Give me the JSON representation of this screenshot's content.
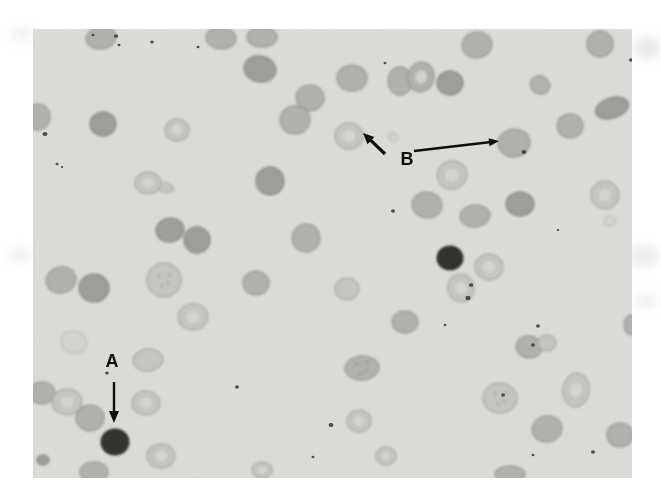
{
  "page": {
    "background": "#ffffff"
  },
  "micrograph": {
    "background": "#dcdcd8",
    "pale_fill": "#d6d6d2",
    "speck_color": "#3a3a38",
    "tones": {
      "light": {
        "fill": "#c5c5c1",
        "rim": "#a4a4a0"
      },
      "mid": {
        "fill": "#b1b1ad",
        "rim": "#92928e"
      },
      "dark_mid": {
        "fill": "#9d9d99",
        "rim": "#81817d"
      },
      "ghost": {
        "fill": "#d3d3cf",
        "rim": "#bbbbb7"
      },
      "very_dark": {
        "fill": "#2d2d2b",
        "rim": "#1b1b19"
      }
    },
    "cells": [
      {
        "x": 68,
        "y": 9,
        "rx": 15,
        "ry": 11,
        "tone": "mid",
        "rot": -8
      },
      {
        "x": 188,
        "y": 9,
        "rx": 15,
        "ry": 11,
        "tone": "mid",
        "rot": 5
      },
      {
        "x": 229,
        "y": 8,
        "rx": 15,
        "ry": 10,
        "tone": "mid"
      },
      {
        "x": 227,
        "y": 40,
        "rx": 16,
        "ry": 13,
        "tone": "dark_mid",
        "rot": 10
      },
      {
        "x": 277,
        "y": 69,
        "rx": 14,
        "ry": 13,
        "tone": "mid"
      },
      {
        "x": 262,
        "y": 91,
        "rx": 15,
        "ry": 14,
        "tone": "mid"
      },
      {
        "x": 5,
        "y": 88,
        "rx": 12,
        "ry": 13,
        "tone": "mid"
      },
      {
        "x": 70,
        "y": 95,
        "rx": 13,
        "ry": 12,
        "tone": "dark_mid"
      },
      {
        "x": 144,
        "y": 101,
        "rx": 12,
        "ry": 11,
        "tone": "light",
        "pale": true
      },
      {
        "x": 115,
        "y": 154,
        "rx": 13,
        "ry": 11,
        "tone": "light",
        "pale": true,
        "tail": {
          "dx": 16,
          "dy": 4,
          "rx": 10,
          "ry": 5,
          "rot": 16
        }
      },
      {
        "x": 237,
        "y": 152,
        "rx": 14,
        "ry": 14,
        "tone": "dark_mid"
      },
      {
        "x": 137,
        "y": 201,
        "rx": 14,
        "ry": 12,
        "tone": "dark_mid",
        "rot": -10
      },
      {
        "x": 164,
        "y": 211,
        "rx": 13,
        "ry": 13,
        "tone": "dark_mid"
      },
      {
        "x": 273,
        "y": 209,
        "rx": 14,
        "ry": 14,
        "tone": "mid"
      },
      {
        "x": 28,
        "y": 251,
        "rx": 15,
        "ry": 13,
        "tone": "mid",
        "rot": -15
      },
      {
        "x": 61,
        "y": 259,
        "rx": 15,
        "ry": 14,
        "tone": "dark_mid"
      },
      {
        "x": 131,
        "y": 251,
        "rx": 17,
        "ry": 17,
        "tone": "light",
        "mottle": true
      },
      {
        "x": 223,
        "y": 254,
        "rx": 13,
        "ry": 12,
        "tone": "mid"
      },
      {
        "x": 160,
        "y": 288,
        "rx": 15,
        "ry": 13,
        "tone": "light",
        "pale": true
      },
      {
        "x": 41,
        "y": 313,
        "rx": 13,
        "ry": 11,
        "tone": "ghost",
        "rot": 20
      },
      {
        "x": 115,
        "y": 331,
        "rx": 15,
        "ry": 11,
        "tone": "light",
        "rot": -5
      },
      {
        "x": 9,
        "y": 364,
        "rx": 13,
        "ry": 11,
        "tone": "mid"
      },
      {
        "x": 34,
        "y": 373,
        "rx": 15,
        "ry": 13,
        "tone": "light",
        "pale": true
      },
      {
        "x": 57,
        "y": 389,
        "rx": 14,
        "ry": 13,
        "tone": "mid"
      },
      {
        "x": 113,
        "y": 374,
        "rx": 14,
        "ry": 12,
        "tone": "light",
        "pale": true
      },
      {
        "x": 82,
        "y": 413,
        "rx": 14,
        "ry": 13,
        "tone": "very_dark"
      },
      {
        "x": 128,
        "y": 427,
        "rx": 14,
        "ry": 12,
        "tone": "light",
        "pale": true
      },
      {
        "x": 61,
        "y": 443,
        "rx": 14,
        "ry": 10,
        "tone": "mid"
      },
      {
        "x": 10,
        "y": 431,
        "rx": 6,
        "ry": 5,
        "tone": "dark_mid"
      },
      {
        "x": 319,
        "y": 49,
        "rx": 15,
        "ry": 13,
        "tone": "mid"
      },
      {
        "x": 367,
        "y": 52,
        "rx": 12,
        "ry": 14,
        "tone": "mid"
      },
      {
        "x": 388,
        "y": 48,
        "rx": 13,
        "ry": 15,
        "tone": "mid",
        "pale": true,
        "rot": 15
      },
      {
        "x": 417,
        "y": 54,
        "rx": 13,
        "ry": 12,
        "tone": "dark_mid"
      },
      {
        "x": 444,
        "y": 16,
        "rx": 15,
        "ry": 13,
        "tone": "mid",
        "rot": -10
      },
      {
        "x": 567,
        "y": 15,
        "rx": 13,
        "ry": 13,
        "tone": "mid"
      },
      {
        "x": 507,
        "y": 56,
        "rx": 10,
        "ry": 9,
        "tone": "mid",
        "rot": 25
      },
      {
        "x": 579,
        "y": 79,
        "rx": 17,
        "ry": 10,
        "tone": "dark_mid",
        "rot": -18
      },
      {
        "x": 537,
        "y": 97,
        "rx": 13,
        "ry": 12,
        "tone": "mid"
      },
      {
        "x": 316,
        "y": 107,
        "rx": 14,
        "ry": 13,
        "tone": "light",
        "pale": true
      },
      {
        "x": 481,
        "y": 114,
        "rx": 16,
        "ry": 14,
        "tone": "mid",
        "rot": -8
      },
      {
        "x": 419,
        "y": 146,
        "rx": 15,
        "ry": 14,
        "tone": "light",
        "pale": true,
        "rot": -20
      },
      {
        "x": 394,
        "y": 176,
        "rx": 15,
        "ry": 13,
        "tone": "mid",
        "rot": 10
      },
      {
        "x": 442,
        "y": 187,
        "rx": 15,
        "ry": 11,
        "tone": "mid",
        "rot": -5
      },
      {
        "x": 487,
        "y": 175,
        "rx": 14,
        "ry": 12,
        "tone": "dark_mid"
      },
      {
        "x": 572,
        "y": 166,
        "rx": 14,
        "ry": 14,
        "tone": "light",
        "pale": true
      },
      {
        "x": 417,
        "y": 229,
        "rx": 13,
        "ry": 12,
        "tone": "very_dark"
      },
      {
        "x": 456,
        "y": 238,
        "rx": 14,
        "ry": 13,
        "tone": "light",
        "pale": true,
        "rot": 10
      },
      {
        "x": 428,
        "y": 259,
        "rx": 13,
        "ry": 14,
        "tone": "light",
        "pale": true,
        "rot": -12
      },
      {
        "x": 314,
        "y": 260,
        "rx": 12,
        "ry": 11,
        "tone": "light"
      },
      {
        "x": 372,
        "y": 293,
        "rx": 13,
        "ry": 11,
        "tone": "mid"
      },
      {
        "x": 496,
        "y": 318,
        "rx": 13,
        "ry": 11,
        "tone": "mid",
        "rot": 8
      },
      {
        "x": 514,
        "y": 314,
        "rx": 9,
        "ry": 8,
        "tone": "light"
      },
      {
        "x": 329,
        "y": 339,
        "rx": 17,
        "ry": 12,
        "tone": "mid",
        "mottle": true,
        "rot": -5
      },
      {
        "x": 467,
        "y": 369,
        "rx": 17,
        "ry": 15,
        "tone": "light",
        "mottle": true
      },
      {
        "x": 543,
        "y": 361,
        "rx": 13,
        "ry": 17,
        "tone": "light",
        "pale": true,
        "rot": 8
      },
      {
        "x": 514,
        "y": 400,
        "rx": 15,
        "ry": 13,
        "tone": "mid",
        "rot": -12
      },
      {
        "x": 587,
        "y": 406,
        "rx": 13,
        "ry": 12,
        "tone": "mid"
      },
      {
        "x": 353,
        "y": 427,
        "rx": 10,
        "ry": 9,
        "tone": "light",
        "pale": true
      },
      {
        "x": 477,
        "y": 445,
        "rx": 15,
        "ry": 8,
        "tone": "mid"
      },
      {
        "x": 326,
        "y": 392,
        "rx": 12,
        "ry": 11,
        "tone": "light",
        "pale": true
      },
      {
        "x": 229,
        "y": 441,
        "rx": 10,
        "ry": 8,
        "tone": "light",
        "pale": true
      },
      {
        "x": 577,
        "y": 192,
        "rx": 6,
        "ry": 5,
        "tone": "ghost"
      },
      {
        "x": 599,
        "y": 296,
        "rx": 8,
        "ry": 10,
        "tone": "mid"
      },
      {
        "x": 360,
        "y": 108,
        "rx": 5,
        "ry": 4,
        "tone": "ghost",
        "rot": 30
      }
    ],
    "specks": [
      {
        "x": 83,
        "y": 7,
        "r": 2.2
      },
      {
        "x": 86,
        "y": 16,
        "r": 1.5
      },
      {
        "x": 60,
        "y": 6,
        "r": 1.5
      },
      {
        "x": 119,
        "y": 13,
        "r": 1.8
      },
      {
        "x": 165,
        "y": 18,
        "r": 1.5
      },
      {
        "x": 352,
        "y": 34,
        "r": 1.5
      },
      {
        "x": 598,
        "y": 31,
        "r": 2.0
      },
      {
        "x": 12,
        "y": 105,
        "r": 2.5
      },
      {
        "x": 24,
        "y": 135,
        "r": 1.5
      },
      {
        "x": 29,
        "y": 138,
        "r": 1.2
      },
      {
        "x": 360,
        "y": 182,
        "r": 2.0
      },
      {
        "x": 525,
        "y": 201,
        "r": 1.3
      },
      {
        "x": 491,
        "y": 123,
        "r": 2.5
      },
      {
        "x": 505,
        "y": 297,
        "r": 2.0
      },
      {
        "x": 438,
        "y": 256,
        "r": 2.2
      },
      {
        "x": 435,
        "y": 269,
        "r": 2.6
      },
      {
        "x": 470,
        "y": 366,
        "r": 2.0
      },
      {
        "x": 500,
        "y": 316,
        "r": 2.0
      },
      {
        "x": 204,
        "y": 358,
        "r": 2.0
      },
      {
        "x": 298,
        "y": 396,
        "r": 2.4
      },
      {
        "x": 74,
        "y": 344,
        "r": 1.8
      },
      {
        "x": 280,
        "y": 428,
        "r": 1.5
      },
      {
        "x": 560,
        "y": 423,
        "r": 2.0
      },
      {
        "x": 500,
        "y": 426,
        "r": 1.5
      },
      {
        "x": 412,
        "y": 296,
        "r": 1.4
      }
    ]
  },
  "annotations": {
    "color": "#0d0d0d",
    "a": {
      "label": "A",
      "text_x": 79,
      "text_y": 338,
      "arrow": {
        "x1": 81,
        "y1": 353,
        "x2": 81,
        "y2": 394,
        "width": 2.4,
        "head_l": 12,
        "head_w": 10
      }
    },
    "b": {
      "label": "B",
      "text_x": 374,
      "text_y": 136,
      "arrow_short": {
        "x1": 352,
        "y1": 125,
        "x2": 330,
        "y2": 104,
        "width": 3.2,
        "head_l": 11,
        "head_w": 10
      },
      "arrow_long": {
        "x1": 381,
        "y1": 122,
        "x2": 466,
        "y2": 112,
        "width": 2.4,
        "head_l": 10,
        "head_w": 8
      }
    }
  },
  "artifacts": [
    {
      "x": 634,
      "y": 36,
      "w": 26,
      "h": 24,
      "o": 0.5
    },
    {
      "x": 627,
      "y": 246,
      "w": 34,
      "h": 20,
      "o": 0.45
    },
    {
      "x": 635,
      "y": 294,
      "w": 24,
      "h": 14,
      "o": 0.35
    },
    {
      "x": 12,
      "y": 27,
      "w": 20,
      "h": 14,
      "o": 0.35
    },
    {
      "x": 8,
      "y": 248,
      "w": 24,
      "h": 13,
      "o": 0.4
    }
  ]
}
